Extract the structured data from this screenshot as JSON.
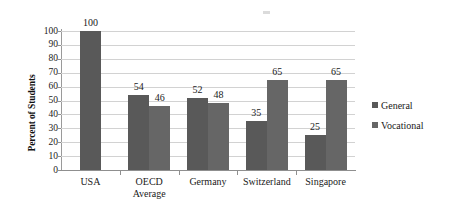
{
  "chart_data": {
    "type": "bar",
    "title": "",
    "subtitle": "",
    "xlabel": "",
    "ylabel": "Percent of Students",
    "ylim": [
      0,
      100
    ],
    "ytick_step": 10,
    "yticks": [
      "100",
      "90",
      "80",
      "70",
      "60",
      "50",
      "40",
      "30",
      "20",
      "10",
      "0"
    ],
    "categories": [
      "USA",
      "OECD\nAverage",
      "Germany",
      "Switzerland",
      "Singapore"
    ],
    "grid": "horizontal",
    "legend_position": "right",
    "series": [
      {
        "name": "General",
        "color": "#595959",
        "values": [
          100,
          54,
          52,
          35,
          25
        ],
        "labels": [
          "100",
          "54",
          "52",
          "35",
          "25"
        ]
      },
      {
        "name": "Vocational",
        "color": "#666666",
        "values": [
          null,
          46,
          48,
          65,
          65
        ],
        "labels": [
          "",
          "46",
          "48",
          "65",
          "65"
        ]
      }
    ]
  },
  "legend": {
    "items": [
      {
        "label": "General",
        "key": "general"
      },
      {
        "label": "Vocational",
        "key": "vocational"
      }
    ]
  }
}
